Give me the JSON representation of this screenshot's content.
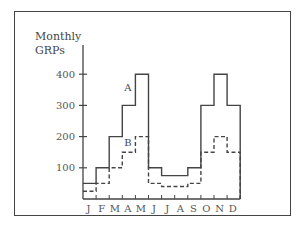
{
  "chart_data": {
    "type": "line",
    "style": "step",
    "title": "",
    "xlabel": "",
    "ylabel": "Monthly GRPs",
    "categories": [
      "J",
      "F",
      "M",
      "A",
      "M",
      "J",
      "J",
      "A",
      "S",
      "O",
      "N",
      "D"
    ],
    "series": [
      {
        "name": "A",
        "line": "solid",
        "values": [
          50,
          100,
          200,
          300,
          400,
          100,
          75,
          75,
          100,
          300,
          400,
          300
        ]
      },
      {
        "name": "B",
        "line": "dashed",
        "values": [
          25,
          50,
          100,
          150,
          200,
          50,
          40,
          40,
          50,
          150,
          200,
          150
        ]
      }
    ],
    "yticks": [
      100,
      200,
      300,
      400
    ],
    "ylim": [
      0,
      500
    ],
    "grid": false,
    "legend": "inline labels A and B"
  },
  "labels": {
    "ylabel_line1": "Monthly",
    "ylabel_line2": "GRPs"
  }
}
